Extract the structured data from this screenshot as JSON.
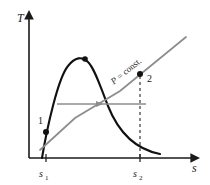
{
  "figure": {
    "name": "temperature-entropy-diagram",
    "width": 210,
    "height": 185,
    "background_color": "#ffffff"
  },
  "axes": {
    "y_axis_label": "T",
    "x_axis_label": "s",
    "axis_color": "#1a1a1a",
    "origin_px": {
      "x": 29,
      "y": 158
    },
    "y_top_px": 14,
    "x_right_px": 196
  },
  "ticks": [
    {
      "id": "s1",
      "label_main": "s",
      "label_sub": "1",
      "x_px": 46
    },
    {
      "id": "s2",
      "label_main": "s",
      "label_sub": "2",
      "x_px": 140
    }
  ],
  "curves": {
    "saturation_dome": {
      "name": "saturation-dome",
      "color": "#111111",
      "stroke_width": 2,
      "peak_px": {
        "x": 85,
        "y": 59
      }
    },
    "pressure_line": {
      "name": "p-const-line",
      "color": "#8c8c8c",
      "stroke_width": 1.6,
      "label": "P = const."
    },
    "process_arrow": {
      "name": "process-arrow",
      "color": "#8c8c8c",
      "stroke_width": 1.6,
      "y_px": 104,
      "x_start_px": 57,
      "x_end_px": 146
    },
    "dashed_drop": {
      "name": "dashed-projection-line",
      "color": "#3a3a3a",
      "dash": "3,3"
    }
  },
  "points": [
    {
      "id": "state-1",
      "label": "1",
      "x_px": 46,
      "y_px": 132,
      "marker_color": "#111111"
    },
    {
      "id": "state-2",
      "label": "2",
      "x_px": 140,
      "y_px": 74,
      "marker_color": "#111111"
    },
    {
      "id": "critical-point",
      "label": "",
      "x_px": 85,
      "y_px": 59,
      "marker_color": "#111111"
    }
  ],
  "labels": {
    "pressure_const_prefix": "P",
    "pressure_const_rest": " = const."
  }
}
